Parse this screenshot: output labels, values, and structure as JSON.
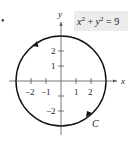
{
  "diagram": {
    "bullet": "•",
    "equation": {
      "text_x": "x",
      "sup1": "2",
      "plus": " + ",
      "text_y": "y",
      "sup2": "2",
      "eq": " = 9",
      "background": "#ececec"
    },
    "axes": {
      "x_label": "x",
      "y_label": "y",
      "x_ticks": [
        "−2",
        "−1",
        "1",
        "2"
      ],
      "y_ticks": [
        "2",
        "1",
        "−2"
      ]
    },
    "curve": {
      "label": "C",
      "equation": "x^2 + y^2 = 9",
      "radius": 3,
      "orientation": "counterclockwise",
      "color": "#111111"
    }
  }
}
